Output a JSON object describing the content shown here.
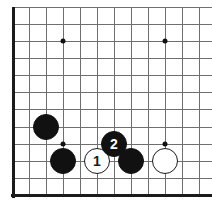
{
  "figure": {
    "kind": "go-board-diagram",
    "width_px": 212,
    "height_px": 207,
    "background_color": "#ffffff"
  },
  "board": {
    "line_color": "#6f6f6f",
    "edge_color": "#1b1b1b",
    "cell_size_px": 17,
    "stone_diameter_px": 26,
    "vertical_lines_x": [
      12,
      29,
      46,
      63,
      80,
      97,
      114,
      131,
      148,
      165,
      182,
      199
    ],
    "horizontal_lines_y": [
      7,
      24,
      41,
      58,
      75,
      92,
      109,
      127,
      144,
      161,
      178,
      195
    ],
    "edges": [
      {
        "name": "left-edge",
        "orientation": "v",
        "x": 12,
        "y": 7,
        "length": 191
      },
      {
        "name": "bottom-edge",
        "orientation": "h",
        "x": 11,
        "y": 194,
        "length": 201
      }
    ],
    "star_points": [
      {
        "name": "star-point-upper-left",
        "x": 63,
        "y": 41
      },
      {
        "name": "star-point-upper-right",
        "x": 165,
        "y": 41
      },
      {
        "name": "star-point-lower-left",
        "x": 63,
        "y": 144
      },
      {
        "name": "star-point-lower-right",
        "x": 165,
        "y": 144
      }
    ]
  },
  "stones": [
    {
      "name": "stone-black-upper-left",
      "color": "black",
      "x": 46,
      "y": 127,
      "label": ""
    },
    {
      "name": "stone-black-lower-left",
      "color": "black",
      "x": 63,
      "y": 161,
      "label": ""
    },
    {
      "name": "stone-white-move-1",
      "color": "white",
      "x": 97,
      "y": 161,
      "label": "1"
    },
    {
      "name": "stone-black-move-2",
      "color": "black",
      "x": 114,
      "y": 144,
      "label": "2"
    },
    {
      "name": "stone-black-lower-center",
      "color": "black",
      "x": 131,
      "y": 161,
      "label": ""
    },
    {
      "name": "stone-white-lower-right",
      "color": "white",
      "x": 165,
      "y": 161,
      "label": ""
    }
  ],
  "colors": {
    "black_stone": "#111111",
    "white_stone": "#ffffff",
    "stone_outline": "#1b1b1b",
    "grid": "#6f6f6f"
  }
}
